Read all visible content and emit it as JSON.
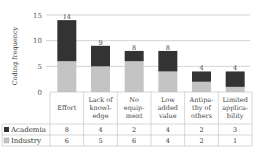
{
  "chart_data": {
    "type": "bar",
    "stacked": true,
    "title": "",
    "xlabel": "",
    "ylabel": "Coding frequency",
    "ylim": [
      0,
      15
    ],
    "yticks": [
      0,
      5,
      10,
      15
    ],
    "grid": true,
    "legend": "table-left",
    "categories": [
      [
        "Effort"
      ],
      [
        "Lack of",
        "knowl-",
        "edge"
      ],
      [
        "No",
        "equip-",
        "ment"
      ],
      [
        "Low",
        "added",
        "value"
      ],
      [
        "Antipa-",
        "thy of",
        "others"
      ],
      [
        "Limited",
        "applica-",
        "bility"
      ]
    ],
    "category_names": [
      "Effort",
      "Lack of knowledge",
      "No equipment",
      "Low added value",
      "Antipathy of others",
      "Limited applicability"
    ],
    "series": [
      {
        "name": "Academia",
        "values": [
          8,
          4,
          2,
          4,
          2,
          3
        ],
        "color": "#333333",
        "marker": "■"
      },
      {
        "name": "Industry",
        "values": [
          6,
          5,
          6,
          4,
          2,
          1
        ],
        "color": "#c4c4c4",
        "marker": "□"
      }
    ],
    "totals": [
      14,
      9,
      8,
      8,
      4,
      4
    ]
  }
}
